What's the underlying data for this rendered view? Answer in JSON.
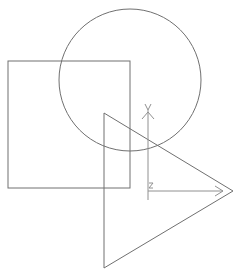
{
  "drawing": {
    "stroke_color": "#707070",
    "background": "#ffffff",
    "shapes": {
      "circle": {
        "cx": 130,
        "cy": 80,
        "r": 71
      },
      "square": {
        "x": 8,
        "y": 61,
        "width": 122,
        "height": 127
      },
      "triangle": {
        "points": "104,113 233,191 104,268"
      }
    },
    "ucs_icon": {
      "origin": {
        "x": 148,
        "y": 191
      },
      "y_axis_label": "Y",
      "x_axis_label": "X",
      "z_label": "Z"
    }
  }
}
